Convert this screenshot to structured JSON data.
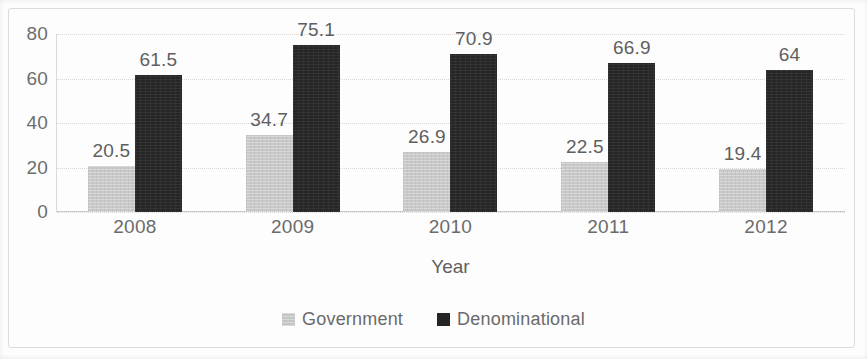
{
  "chart_data": {
    "type": "bar",
    "title": "",
    "xlabel": "Year",
    "ylabel": "",
    "categories": [
      "2008",
      "2009",
      "2010",
      "2011",
      "2012"
    ],
    "series": [
      {
        "name": "Government",
        "color": "#c9c9c9",
        "values": [
          20.5,
          34.7,
          26.9,
          22.5,
          19.4
        ],
        "labels": [
          "20.5",
          "34.7",
          "26.9",
          "22.5",
          "19.4"
        ]
      },
      {
        "name": "Denominational",
        "color": "#262626",
        "values": [
          61.5,
          75.1,
          70.9,
          66.9,
          64
        ],
        "labels": [
          "61.5",
          "75.1",
          "70.9",
          "66.9",
          "64"
        ]
      }
    ],
    "ylim": [
      0,
      80
    ],
    "yticks": [
      80,
      60,
      40,
      20,
      0
    ],
    "ytick_labels": [
      "80",
      "60",
      "40",
      "20",
      "0"
    ],
    "grid": true,
    "grid_axis": "y",
    "legend_position": "bottom-center",
    "data_labels": true
  }
}
